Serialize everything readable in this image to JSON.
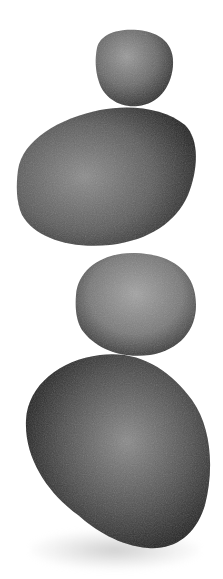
{
  "image": {
    "subject": "Four balanced stacked stones",
    "background_color": "#ffffff",
    "stones": [
      {
        "position": "top",
        "size": "small",
        "tone": "#6e6e6e"
      },
      {
        "position": "second",
        "size": "large",
        "tone": "#4a4a4a"
      },
      {
        "position": "third",
        "size": "medium",
        "tone": "#7a7a7a"
      },
      {
        "position": "bottom",
        "size": "largest",
        "tone": "#3a3a3a"
      }
    ],
    "shadow_color": "#bdbdbd"
  }
}
